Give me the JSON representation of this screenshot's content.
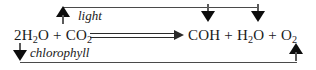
{
  "diagram": {
    "background_color": "#ffffff",
    "text_color": "#1a1a1a",
    "line_color": "#4a4a4a",
    "arrow_color": "#0d0d0d"
  },
  "equation": {
    "reactants": [
      {
        "coefficient": "2",
        "formula_base": "H",
        "sub1": "2",
        "tail": "O",
        "display": "2H2O"
      },
      {
        "coefficient": "",
        "formula_base": "CO",
        "sub1": "2",
        "tail": "",
        "display": "CO2"
      }
    ],
    "products": [
      {
        "coefficient": "",
        "formula_base": "COH",
        "sub1": "",
        "tail": "",
        "display": "COH"
      },
      {
        "coefficient": "",
        "formula_base": "H",
        "sub1": "2",
        "tail": "O",
        "display": "H2O"
      },
      {
        "coefficient": "",
        "formula_base": "O",
        "sub1": "2",
        "tail": "",
        "display": "O2"
      }
    ],
    "plus_symbol": "+",
    "arrow_symbol": "⟹",
    "full_text": "2H2O + CO2 ⟹ COH + H2O + O2"
  },
  "reactant_tokens": {
    "r1_coef": "2",
    "r1_h": "H",
    "r1_sub": "2",
    "r1_o": "O",
    "plus_1": "+",
    "r2_co": "CO",
    "r2_sub": "2"
  },
  "product_tokens": {
    "p1": "COH",
    "plus_1": "+",
    "p2_h": "H",
    "p2_sub": "2",
    "p2_o": "O",
    "plus_2": "+",
    "p3_o": "O",
    "p3_sub": "2"
  },
  "annotations": {
    "light_label": "light",
    "chlorophyll_label": "chlorophyll"
  },
  "arrows": {
    "light_input": "up-arrow",
    "product_marker_1": "down-arrow",
    "product_marker_2": "down-arrow",
    "chlorophyll_input": "down-arrow",
    "recycle_return": "up-arrow"
  }
}
